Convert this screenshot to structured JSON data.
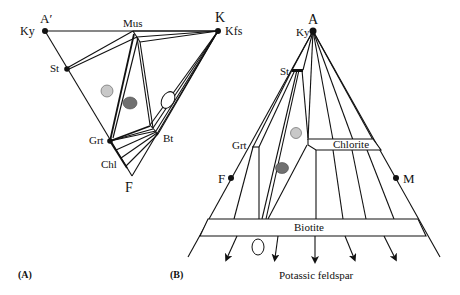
{
  "figure": {
    "panel_a": {
      "caption": "(A)",
      "apex_labels": {
        "top_left": "A′",
        "top_right": "K",
        "bottom": "F"
      },
      "phase_labels": {
        "kyanite": "Ky",
        "kfeldspar": "Kfs",
        "muscovite": "Mus",
        "staurolite": "St",
        "garnet": "Grt",
        "biotite": "Bt",
        "chlorite": "Chl"
      },
      "markers": [
        {
          "type": "circle",
          "fill": "#c8c8c8",
          "description": "light grey circle"
        },
        {
          "type": "circle",
          "fill": "#707070",
          "description": "dark grey circle"
        },
        {
          "type": "ellipse",
          "fill": "#ffffff",
          "description": "open ellipse"
        }
      ]
    },
    "panel_b": {
      "caption": "(B)",
      "apex_labels": {
        "top": "A",
        "left": "F",
        "right": "M"
      },
      "phase_labels": {
        "kyanite": "Ky",
        "staurolite": "St",
        "garnet": "Grt",
        "chlorite": "Chlorite",
        "biotite": "Biotite",
        "projection_point": "Potassic feldspar"
      },
      "markers": [
        {
          "type": "circle",
          "fill": "#c8c8c8",
          "description": "light grey circle"
        },
        {
          "type": "ellipse",
          "fill": "#707070",
          "description": "dark grey ellipse"
        },
        {
          "type": "ellipse",
          "fill": "#ffffff",
          "description": "open ellipse"
        }
      ],
      "arrow_count": 5
    }
  }
}
